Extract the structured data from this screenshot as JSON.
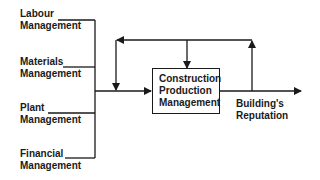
{
  "diagram": {
    "inputs": [
      {
        "line1": "Labour",
        "line2": "Management"
      },
      {
        "line1": "Materials",
        "line2": "Management"
      },
      {
        "line1": "Plant",
        "line2": "Management"
      },
      {
        "line1": "Financial",
        "line2": "Management"
      }
    ],
    "process": {
      "line1": "Construction",
      "line2": "Production",
      "line3": "Management"
    },
    "output": {
      "line1": "Building's",
      "line2": "Reputation"
    },
    "colors": {
      "stroke": "#1a1a1a",
      "background": "#ffffff"
    }
  }
}
